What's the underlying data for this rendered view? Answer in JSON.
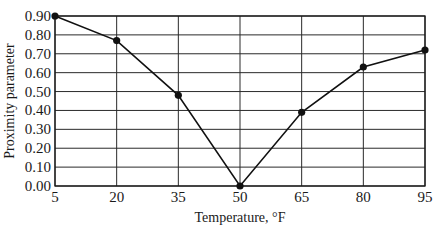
{
  "chart_data": {
    "type": "line",
    "title": "",
    "xlabel": "Temperature, °F",
    "ylabel": "Proximity parameter",
    "x": [
      5,
      20,
      35,
      50,
      65,
      80,
      95
    ],
    "series": [
      {
        "name": "Proximity parameter",
        "values": [
          0.9,
          0.77,
          0.48,
          0.0,
          0.39,
          0.63,
          0.72
        ]
      }
    ],
    "x_ticks": [
      "5",
      "20",
      "35",
      "50",
      "65",
      "80",
      "95"
    ],
    "y_ticks": [
      "0.00",
      "0.10",
      "0.20",
      "0.30",
      "0.40",
      "0.50",
      "0.60",
      "0.70",
      "0.80",
      "0.90"
    ],
    "xlim": [
      5,
      95
    ],
    "ylim": [
      0,
      0.9
    ],
    "grid": true,
    "legend": "none",
    "markers": "filled-circle",
    "colors": {
      "line": "#111111",
      "grid": "#2a2a2a",
      "background": "#ffffff"
    }
  }
}
